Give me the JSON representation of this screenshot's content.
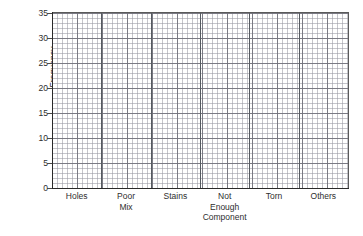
{
  "chart_data": {
    "type": "bar",
    "title": "",
    "subtitle": "",
    "xlabel": "",
    "ylabel": "Frequency",
    "categories": [
      "Holes",
      "Poor Mix",
      "Stains",
      "Not Enough Component",
      "Torn",
      "Others"
    ],
    "category_lines": [
      [
        "Holes"
      ],
      [
        "Poor",
        "Mix"
      ],
      [
        "Stains"
      ],
      [
        "Not",
        "Enough",
        "Component"
      ],
      [
        "Torn"
      ],
      [
        "Others"
      ]
    ],
    "values": [
      0,
      0,
      0,
      0,
      0,
      0
    ],
    "ylim": [
      0,
      35
    ],
    "ytick_labels": [
      "0",
      "5",
      "10",
      "15",
      "20",
      "25",
      "30",
      "35"
    ],
    "ytick_values": [
      0,
      5,
      10,
      15,
      20,
      25,
      30,
      35
    ],
    "ytick_step": 5,
    "grid": true,
    "grid_style": "graph-paper",
    "grid_minor_step_px": 5,
    "grid_major_step_px": 25,
    "legend": false,
    "legend_position": "none",
    "bars_drawn": false,
    "note": "Blank frequency tally chart template (no bars plotted)",
    "colors": {
      "axis": "#2a2a2a",
      "grid_major": "#6e6e78",
      "grid_minor": "#9696a0",
      "text": "#2e2e2e",
      "background": "#ffffff",
      "divider": "#555a60"
    }
  },
  "axes": {
    "y_title": "Frequency"
  }
}
